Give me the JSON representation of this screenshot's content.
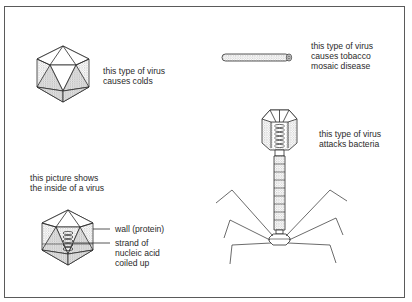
{
  "diagram": {
    "colors": {
      "line": "#2b2b2b",
      "stipple": "#b5b5b5",
      "frame": "#5a5a5a",
      "text": "#2a2a2a"
    },
    "items": [
      {
        "id": "cold-virus",
        "shape": "icosahedron",
        "label_lines": [
          "this type of virus",
          "causes colds"
        ]
      },
      {
        "id": "tobacco-mosaic-virus",
        "shape": "rod",
        "label_lines": [
          "this type of virus",
          "causes tobacco",
          "mosaic disease"
        ]
      },
      {
        "id": "bacteriophage",
        "shape": "head-tail-legs",
        "label_lines": [
          "this type of virus",
          "attacks bacteria"
        ]
      },
      {
        "id": "virus-interior",
        "shape": "icosahedron-cutaway",
        "caption_lines": [
          "this picture shows",
          "the inside of a virus"
        ],
        "callouts": [
          {
            "target": "wall",
            "label_lines": [
              "wall (protein)"
            ]
          },
          {
            "target": "nucleic-acid",
            "label_lines": [
              "strand of",
              "nucleic acid",
              "coiled up"
            ]
          }
        ]
      }
    ]
  }
}
